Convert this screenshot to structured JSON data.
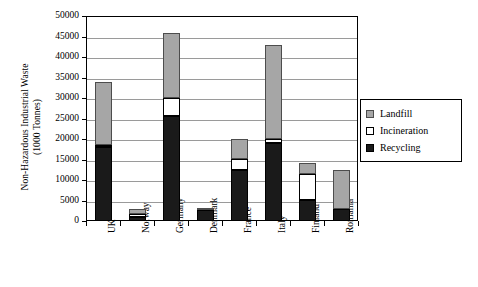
{
  "chart_data": {
    "type": "bar",
    "subtype": "stacked-bar",
    "title": "",
    "xlabel": "",
    "ylabel": "Non-Hazardous Industrial Waste (1000 Tonnes)",
    "ylabel_lines": [
      "Non-Hazardous Industrial Waste",
      "(1000 Tonnes)"
    ],
    "categories": [
      "UK",
      "Norway",
      "Germany",
      "Denmark",
      "France",
      "Italy",
      "Finland",
      "Romania"
    ],
    "series": [
      {
        "name": "Recycling",
        "color": "#1a1a1a",
        "values": [
          18000,
          1000,
          25500,
          2800,
          12500,
          19000,
          5200,
          3000
        ]
      },
      {
        "name": "Incineration",
        "color": "#ffffff",
        "values": [
          600,
          800,
          4500,
          100,
          2700,
          1100,
          6300,
          0
        ]
      },
      {
        "name": "Landfill",
        "color": "#a6a6a6",
        "values": [
          15400,
          1200,
          15800,
          200,
          4800,
          22900,
          2700,
          9500
        ]
      }
    ],
    "stack_order": [
      "Recycling",
      "Incineration",
      "Landfill"
    ],
    "totals": [
      34000,
      3000,
      45800,
      3100,
      20000,
      43000,
      14200,
      12500
    ],
    "ylim": [
      0,
      50000
    ],
    "yticks": [
      0,
      5000,
      10000,
      15000,
      20000,
      25000,
      30000,
      35000,
      40000,
      45000,
      50000
    ],
    "ytick_labels": [
      "0",
      "5000",
      "10000",
      "15000",
      "20000",
      "25000",
      "30000",
      "35000",
      "40000",
      "45000",
      "50000"
    ],
    "grid": true,
    "grid_axis": "y",
    "legend_position": "right",
    "legend_entries": [
      {
        "label": "Landfill",
        "swatch": "landfill-swatch",
        "color": "#a6a6a6"
      },
      {
        "label": "Incineration",
        "swatch": "incineration-swatch",
        "color": "#ffffff"
      },
      {
        "label": "Recycling",
        "swatch": "recycling-swatch",
        "color": "#1a1a1a"
      }
    ]
  }
}
